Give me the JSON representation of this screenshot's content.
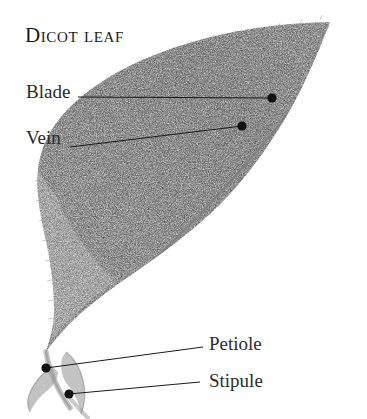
{
  "figure": {
    "title": "Dicot leaf",
    "background_color": "#ffffff",
    "ink_color": "#1a1a1a",
    "leaf_tone_dark": "#8d8d8d",
    "leaf_tone_mid": "#aaaaaa",
    "leaf_tone_light": "#c9c9c9"
  },
  "labels": [
    {
      "id": "blade",
      "text": "Blade",
      "text_x": 26,
      "text_y": 82,
      "line_from_x": 78,
      "line_from_y": 97,
      "line_to_x": 272,
      "line_to_y": 98,
      "dot_x": 272,
      "dot_y": 98
    },
    {
      "id": "vein",
      "text": "Vein",
      "text_x": 26,
      "text_y": 128,
      "line_from_x": 70,
      "line_from_y": 147,
      "line_to_x": 242,
      "line_to_y": 126,
      "dot_x": 242,
      "dot_y": 126
    },
    {
      "id": "petiole",
      "text": "Petiole",
      "text_x": 209,
      "text_y": 334,
      "line_from_x": 203,
      "line_from_y": 347,
      "line_to_x": 46,
      "line_to_y": 368,
      "dot_x": 46,
      "dot_y": 368
    },
    {
      "id": "stipule",
      "text": "Stipule",
      "text_x": 209,
      "text_y": 371,
      "line_from_x": 200,
      "line_from_y": 382,
      "line_to_x": 69,
      "line_to_y": 394,
      "dot_x": 69,
      "dot_y": 394
    }
  ]
}
